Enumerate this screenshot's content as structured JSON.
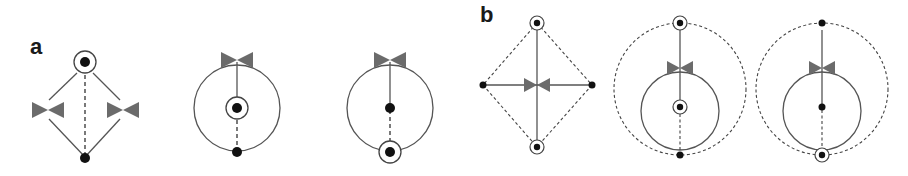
{
  "panels": [
    {
      "label": "a"
    },
    {
      "label": "b"
    }
  ],
  "colors": {
    "line": "#555555",
    "vertex": "#111111",
    "bowtie": "#6b6b6b",
    "label": "#1a1a1a",
    "background": "#ffffff"
  },
  "diagrams": {
    "a1": {
      "description": "Circled vertex at top, two bow-tie insertions on left and right paths, dashed edge to bottom vertex",
      "elements": [
        "circled-vertex",
        "bowtie",
        "bowtie",
        "vertex"
      ]
    },
    "a2": {
      "description": "Loop with bow-tie at top, solid line to circled center vertex, dashed line to bottom vertex",
      "elements": [
        "bowtie",
        "circled-vertex",
        "vertex"
      ]
    },
    "a3": {
      "description": "Loop with bow-tie at top, solid line to center vertex, dashed line to circled bottom vertex",
      "elements": [
        "bowtie",
        "vertex",
        "circled-vertex"
      ]
    },
    "b1": {
      "description": "Diamond of dashed edges; solid cross through central bow-tie; circled top and bottom vertices, plain left and right vertices",
      "elements": [
        "circled-vertex",
        "circled-vertex",
        "vertex",
        "vertex",
        "bowtie"
      ]
    },
    "b2": {
      "description": "Dashed outer circle, solid inner loop with bow-tie; circled top and center vertices, plain bottom vertex",
      "elements": [
        "circled-vertex",
        "bowtie",
        "circled-vertex",
        "vertex"
      ]
    },
    "b3": {
      "description": "Dashed outer circle, solid inner loop with bow-tie; plain top and center vertices, circled bottom vertex",
      "elements": [
        "vertex",
        "bowtie",
        "vertex",
        "circled-vertex"
      ]
    }
  }
}
